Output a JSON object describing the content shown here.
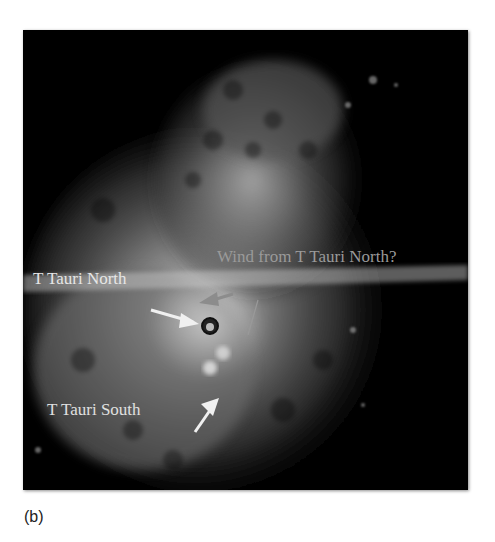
{
  "figure": {
    "labels": {
      "north": "T Tauri North",
      "south": "T Tauri South",
      "wind": "Wind from T Tauri North?"
    },
    "caption": "(b)",
    "colors": {
      "background": "#000000",
      "nebula": "#b4b4b4",
      "label_white": "#e6e6e6",
      "label_gray": "#9a9a9a",
      "arrow_white": "#f0f0f0",
      "arrow_gray": "#8c8c8c"
    }
  }
}
